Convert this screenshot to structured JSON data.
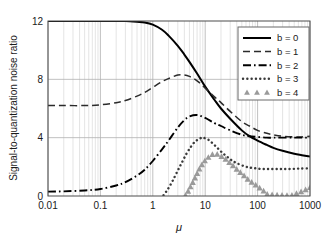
{
  "chart_data": {
    "type": "line",
    "title": "",
    "xlabel": "μ",
    "ylabel": "Signal-to-quantization noise ratio",
    "xscale": "log",
    "yscale": "linear",
    "xlim": [
      0.01,
      1000
    ],
    "ylim": [
      0,
      12
    ],
    "grid": true,
    "grid_minor": true,
    "legend_position": "upper-right",
    "xticks": [
      "0.01",
      "0.1",
      "1",
      "10",
      "100",
      "1000"
    ],
    "xtick_values": [
      0.01,
      0.1,
      1,
      10,
      100,
      1000
    ],
    "yticks": [
      "0",
      "4",
      "8",
      "12"
    ],
    "ytick_values": [
      0,
      4,
      8,
      12
    ],
    "series": [
      {
        "name": "b = 0",
        "style": "solid",
        "color": "#000000",
        "x": [
          0.01,
          0.02,
          0.05,
          0.1,
          0.2,
          0.3,
          0.5,
          0.7,
          1,
          1.5,
          2,
          3,
          4,
          5,
          7,
          10,
          15,
          20,
          30,
          50,
          70,
          100,
          150,
          200,
          300,
          500,
          700,
          1000
        ],
        "y": [
          12.0,
          12.0,
          12.0,
          12.0,
          12.0,
          12.0,
          11.95,
          11.9,
          11.75,
          11.4,
          11.0,
          10.3,
          9.7,
          9.2,
          8.4,
          7.5,
          6.6,
          6.0,
          5.3,
          4.5,
          4.1,
          3.8,
          3.5,
          3.3,
          3.1,
          2.9,
          2.8,
          2.7
        ]
      },
      {
        "name": "b = 1",
        "style": "dashed",
        "color": "#2b2b2b",
        "x": [
          0.01,
          0.02,
          0.05,
          0.1,
          0.2,
          0.3,
          0.5,
          0.7,
          1,
          1.5,
          2,
          3,
          4,
          5,
          7,
          10,
          15,
          20,
          30,
          50,
          70,
          100,
          150,
          200,
          300,
          500,
          700,
          1000
        ],
        "y": [
          6.2,
          6.2,
          6.2,
          6.25,
          6.4,
          6.55,
          6.85,
          7.1,
          7.45,
          7.85,
          8.05,
          8.3,
          8.3,
          8.2,
          7.9,
          7.4,
          6.8,
          6.4,
          5.8,
          5.1,
          4.8,
          4.5,
          4.3,
          4.2,
          4.1,
          4.05,
          4.05,
          4.1
        ]
      },
      {
        "name": "b = 2",
        "style": "dashdot",
        "color": "#000000",
        "x": [
          0.01,
          0.02,
          0.05,
          0.1,
          0.2,
          0.3,
          0.5,
          0.7,
          1,
          1.5,
          2,
          3,
          4,
          5,
          7,
          10,
          15,
          20,
          30,
          50,
          70,
          100,
          150,
          200,
          300,
          500,
          700,
          1000
        ],
        "y": [
          0.3,
          0.32,
          0.38,
          0.48,
          0.72,
          0.95,
          1.4,
          1.8,
          2.4,
          3.2,
          3.8,
          4.7,
          5.2,
          5.45,
          5.55,
          5.35,
          5.0,
          4.8,
          4.5,
          4.2,
          4.1,
          4.05,
          4.0,
          4.0,
          4.0,
          4.0,
          4.0,
          4.0
        ]
      },
      {
        "name": "b = 3",
        "style": "dotted",
        "color": "#3a3a3a",
        "x": [
          1.6,
          1.8,
          2,
          2.4,
          3,
          3.6,
          4.4,
          5.4,
          6.5,
          8,
          9,
          11,
          13,
          16,
          20,
          25,
          32,
          40,
          55,
          70,
          90,
          120,
          160,
          220,
          300,
          420,
          600,
          1000
        ],
        "y": [
          0.05,
          0.3,
          0.55,
          1.05,
          1.75,
          2.3,
          2.9,
          3.4,
          3.75,
          3.95,
          4.0,
          3.9,
          3.7,
          3.4,
          3.05,
          2.75,
          2.45,
          2.25,
          2.05,
          1.95,
          1.9,
          1.85,
          1.85,
          1.85,
          1.85,
          1.85,
          1.88,
          1.9
        ]
      },
      {
        "name": "b = 4",
        "style": "markers",
        "marker": "triangle",
        "color": "#9a9a9a",
        "x": [
          4.2,
          5,
          5.8,
          6.8,
          8,
          9.5,
          11,
          13,
          15,
          18,
          21,
          25,
          30,
          36,
          44,
          55,
          68,
          85,
          105,
          130,
          160,
          420,
          520,
          620,
          760,
          900,
          1000
        ],
        "y": [
          0.05,
          0.5,
          0.95,
          1.45,
          1.95,
          2.35,
          2.6,
          2.8,
          2.9,
          2.85,
          2.7,
          2.5,
          2.25,
          2.0,
          1.7,
          1.4,
          1.1,
          0.85,
          0.6,
          0.35,
          0.12,
          0.05,
          0.15,
          0.25,
          0.38,
          0.52,
          0.6
        ]
      }
    ]
  },
  "legend": {
    "items": [
      {
        "label": "b = 0"
      },
      {
        "label": "b = 1"
      },
      {
        "label": "b = 2"
      },
      {
        "label": "b = 3"
      },
      {
        "label": "b = 4"
      }
    ]
  }
}
